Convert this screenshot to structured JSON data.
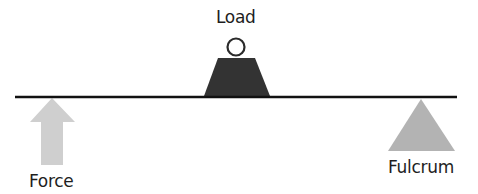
{
  "diagram": {
    "type": "lever",
    "labels": {
      "load": "Load",
      "force": "Force",
      "fulcrum": "Fulcrum"
    },
    "colors": {
      "beam": "#111111",
      "load_weight": "#333333",
      "force_arrow": "#cfcfcf",
      "fulcrum": "#b3b3b3",
      "text": "#1e1e1e",
      "background": "#ffffff"
    },
    "elements": {
      "beam": {
        "x1": 15,
        "x2": 457,
        "y": 97
      },
      "load": {
        "position": "center",
        "shape": "weight-with-ring"
      },
      "force": {
        "position": "left",
        "direction": "up",
        "shape": "arrow"
      },
      "fulcrum": {
        "position": "right",
        "shape": "triangle"
      }
    }
  }
}
